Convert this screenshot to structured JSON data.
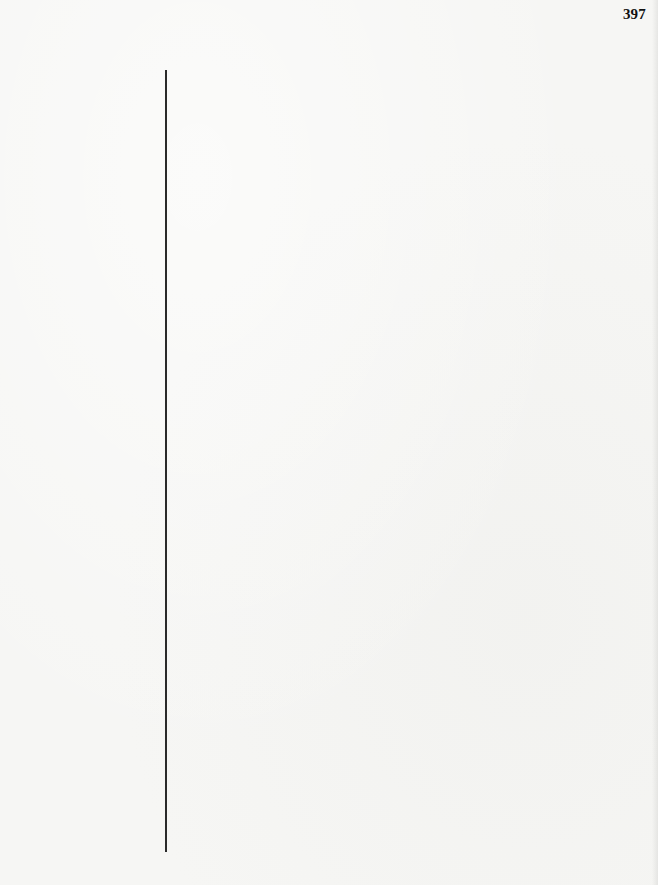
{
  "page": {
    "page_number": "397",
    "background_color": "#f6f6f4",
    "rule_color": "#2a2a2a"
  }
}
